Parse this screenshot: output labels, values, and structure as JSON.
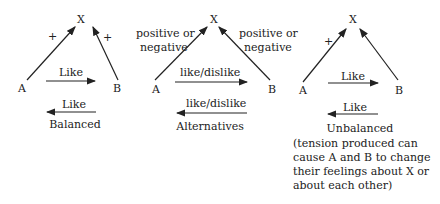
{
  "diagrams": [
    {
      "name": "balanced",
      "nodes": {
        "a": "A",
        "b": "B",
        "x": "X"
      },
      "edge_ax": "+",
      "edge_bx": "+",
      "a_to_b": "Like",
      "b_to_a": "Like",
      "caption": "Balanced"
    },
    {
      "name": "alternatives",
      "nodes": {
        "a": "A",
        "b": "B",
        "x": "X"
      },
      "edge_ax": "positive or negative",
      "edge_ax_l1": "positive or",
      "edge_ax_l2": "negative",
      "edge_bx_l1": "positive or",
      "edge_bx_l2": "negative",
      "a_to_b": "like/dislike",
      "b_to_a": "like/dislike",
      "caption": "Alternatives"
    },
    {
      "name": "unbalanced",
      "nodes": {
        "a": "A",
        "b": "B",
        "x": "X"
      },
      "edge_ax": "+",
      "a_to_b": "Like",
      "b_to_a": "Like",
      "caption": "Unbalanced",
      "note_l1": "(tension produced can",
      "note_l2": "cause A and B to change",
      "note_l3": "their feelings about X or",
      "note_l4": "about each other)"
    }
  ]
}
